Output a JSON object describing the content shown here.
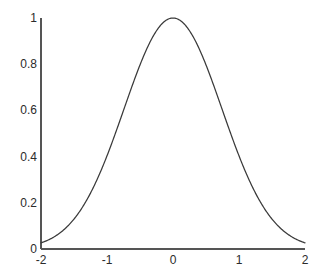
{
  "chart_data": {
    "type": "line",
    "title": "",
    "subtitle": "",
    "xlabel": "",
    "ylabel": "",
    "xlim": [
      -2,
      2
    ],
    "ylim": [
      0,
      1
    ],
    "grid": false,
    "legend": null,
    "legend_position": "none",
    "annotations": [],
    "xticks": [
      -2,
      -1,
      0,
      1,
      2
    ],
    "xtick_labels": [
      "-2",
      "-1",
      "0",
      "1",
      "2"
    ],
    "yticks": [
      0,
      0.2,
      0.4,
      0.6,
      0.8,
      1
    ],
    "ytick_labels": [
      "0",
      "0.2",
      "0.4",
      "0.6",
      "0.8",
      "1"
    ],
    "series": [
      {
        "name": "gaussian",
        "description": "Gaussian bell curve, peak 1.0 at x=0, sigma approximately 0.742",
        "color": "#3a3a3a",
        "peak_x": 0,
        "peak_y": 1,
        "sigma": 0.742,
        "x": [
          -2,
          -1.9,
          -1.8,
          -1.7,
          -1.6,
          -1.5,
          -1.4,
          -1.3,
          -1.2,
          -1.1,
          -1,
          -0.9,
          -0.8,
          -0.7,
          -0.6,
          -0.5,
          -0.4,
          -0.3,
          -0.2,
          -0.1,
          0,
          0.1,
          0.2,
          0.3,
          0.4,
          0.5,
          0.6,
          0.7,
          0.8,
          0.9,
          1,
          1.1,
          1.2,
          1.3,
          1.4,
          1.5,
          1.6,
          1.7,
          1.8,
          1.9,
          2
        ],
        "values": [
          0.027,
          0.039,
          0.054,
          0.074,
          0.098,
          0.129,
          0.166,
          0.21,
          0.262,
          0.32,
          0.385,
          0.454,
          0.527,
          0.6,
          0.671,
          0.739,
          0.8,
          0.853,
          0.914,
          0.991,
          1,
          0.991,
          0.914,
          0.853,
          0.8,
          0.739,
          0.671,
          0.6,
          0.527,
          0.454,
          0.385,
          0.32,
          0.262,
          0.21,
          0.166,
          0.129,
          0.098,
          0.074,
          0.054,
          0.039,
          0.027
        ]
      }
    ],
    "axis_color": "#555555",
    "background_color": "#ffffff"
  },
  "figure": {
    "plot_box": {
      "left_px": 41,
      "right_px": 305,
      "top_px": 18,
      "bottom_px": 249
    }
  }
}
